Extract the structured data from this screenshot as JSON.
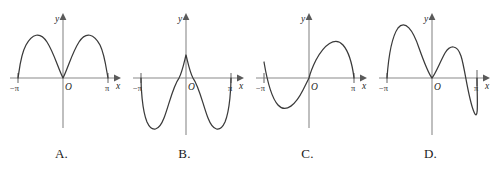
{
  "figure": {
    "kind": "multiple-choice-graph-options",
    "axis": {
      "y_label": "y",
      "x_label": "x",
      "origin_label": "O",
      "left_tick_label": "−π",
      "right_tick_label": "π"
    }
  },
  "options": [
    {
      "id": "A",
      "label": "A.",
      "description": "two positive humps touching zero at -pi, 0 and pi",
      "path": "M 18,78 C 19,74 20,56 26,45 C 32,34 40,31 47,42 C 54,53 58,68 63,78 C 68,68 72,53 79,42 C 86,31 94,34 100,45 C 105,55 107,74 108,78"
    },
    {
      "id": "B",
      "label": "B.",
      "description": "even curve with two small peaks near origin and two deep troughs",
      "path": "M 18,78 C 18,86 19,110 24,122 C 29,133 36,131 41,118 C 46,105 50,86 56,78 C 59,73 61,63 63,55 C 65,63 67,73 70,78 C 76,86 80,105 85,118 C 90,131 97,133 102,122 C 107,110 108,86 108,78"
    },
    {
      "id": "C",
      "label": "C.",
      "description": "odd single oscillation: trough on the left, peak on the right",
      "path": "M 18,62 C 20,74 24,96 32,105 C 40,114 50,104 57,90 C 62,80 63,78 63,78 C 63,78 65,70 70,60 C 78,45 89,36 97,45 C 104,53 107,70 108,78"
    },
    {
      "id": "D",
      "label": "D.",
      "description": "odd curve: tall left peak, dip, small peak, deep right trough",
      "path": "M 18,78 C 19,64 22,38 29,28 C 36,19 44,30 50,48 C 55,62 59,73 63,78 C 67,73 71,62 76,53 C 81,45 88,44 92,56 C 96,68 99,98 105,112 C 110,124 108,96 108,78"
    }
  ]
}
